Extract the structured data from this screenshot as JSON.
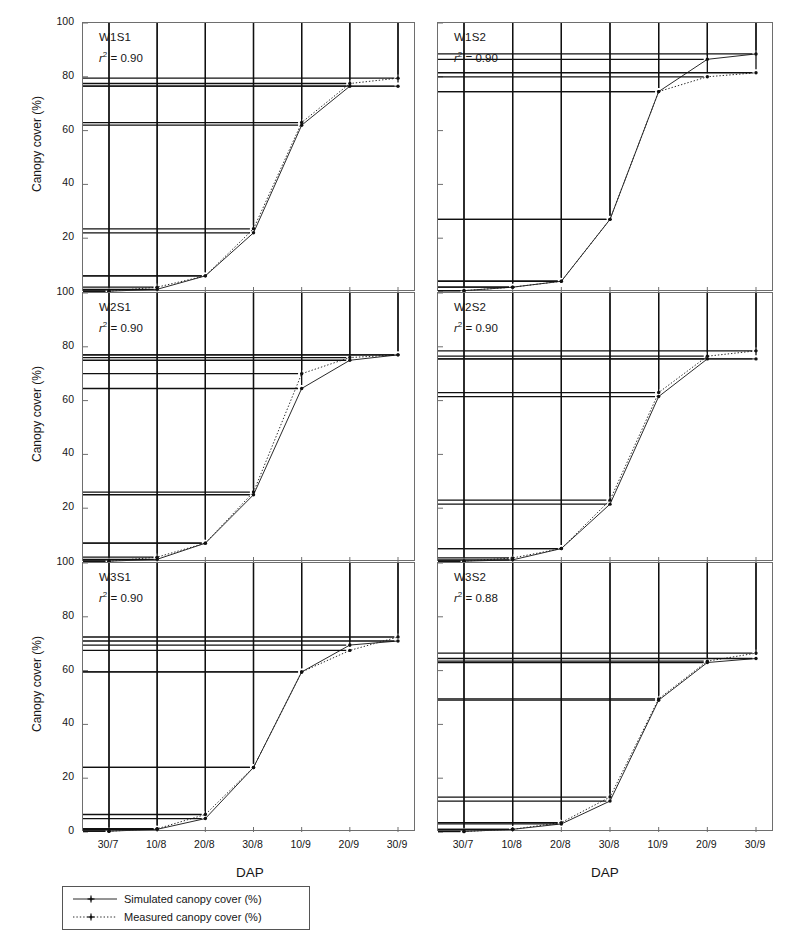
{
  "figure": {
    "axis_titles": {
      "y": "Canopy cover (%)",
      "x": "DAP"
    },
    "y_ticks": [
      "100",
      "80",
      "60",
      "40",
      "20",
      "0"
    ],
    "x_ticks": [
      "30/7",
      "10/8",
      "20/8",
      "30/8",
      "10/9",
      "20/9",
      "30/9"
    ],
    "legend": {
      "simulated": "Simulated canopy cover (%)",
      "measured": "Measured canopy cover (%)"
    },
    "colors": {
      "line": "#2a2a2a",
      "frame": "#6e6e6e",
      "marker": "#101010",
      "text": "#161616",
      "background": "#ffffff"
    }
  },
  "chart_data": {
    "type": "line",
    "title": "",
    "xlabel": "DAP",
    "ylabel": "Canopy cover (%)",
    "x": [
      "30/7",
      "10/8",
      "20/8",
      "30/8",
      "10/9",
      "20/9",
      "30/9"
    ],
    "ylim": [
      0,
      100
    ],
    "xlim_ticks": 7,
    "grid": false,
    "legend_position": "bottom-left",
    "panels": [
      {
        "id": "W1S1",
        "label": "W1S1",
        "r2_label": "r",
        "r2_sup": "2",
        "r2_value": "= 0.90",
        "r2_text": "r2 = 0.90",
        "row": 0,
        "col": 0,
        "series": [
          {
            "name": "Simulated canopy cover (%)",
            "style": "solid",
            "values": [
              0.3,
              1.0,
              6.0,
              22.0,
              62.0,
              76.5,
              76.5
            ]
          },
          {
            "name": "Measured canopy cover (%)",
            "style": "dotted",
            "values": [
              0.3,
              1.8,
              6.0,
              23.5,
              63.0,
              77.5,
              79.5
            ]
          }
        ]
      },
      {
        "id": "W1S2",
        "label": "W1S2",
        "r2_label": "r",
        "r2_sup": "2",
        "r2_value": "= 0.90",
        "r2_text": "r2 = 0.90",
        "row": 0,
        "col": 1,
        "series": [
          {
            "name": "Simulated canopy cover (%)",
            "style": "solid",
            "values": [
              0.5,
              1.8,
              4.0,
              27.0,
              74.5,
              86.5,
              88.5
            ]
          },
          {
            "name": "Measured canopy cover (%)",
            "style": "dotted",
            "values": [
              0.5,
              1.8,
              4.0,
              27.0,
              74.5,
              80.0,
              81.5
            ]
          }
        ]
      },
      {
        "id": "W2S1",
        "label": "W2S1",
        "r2_label": "r",
        "r2_sup": "2",
        "r2_value": "= 0.90",
        "r2_text": "r2 = 0.90",
        "row": 1,
        "col": 0,
        "series": [
          {
            "name": "Simulated canopy cover (%)",
            "style": "solid",
            "values": [
              0.3,
              1.0,
              7.0,
              25.0,
              64.5,
              75.0,
              77.0
            ]
          },
          {
            "name": "Measured canopy cover (%)",
            "style": "dotted",
            "values": [
              0.3,
              1.8,
              7.0,
              26.0,
              70.0,
              76.0,
              77.0
            ]
          }
        ]
      },
      {
        "id": "W2S2",
        "label": "W2S2",
        "r2_label": "r",
        "r2_sup": "2",
        "r2_value": "= 0.90",
        "r2_text": "r2 = 0.90",
        "row": 1,
        "col": 1,
        "series": [
          {
            "name": "Simulated canopy cover (%)",
            "style": "solid",
            "values": [
              0.3,
              0.8,
              5.0,
              21.5,
              61.5,
              75.5,
              75.5
            ]
          },
          {
            "name": "Measured canopy cover (%)",
            "style": "dotted",
            "values": [
              0.3,
              1.5,
              5.0,
              23.0,
              63.0,
              76.5,
              78.5
            ]
          }
        ]
      },
      {
        "id": "W3S1",
        "label": "W3S1",
        "r2_label": "r",
        "r2_sup": "2",
        "r2_value": "= 0.90",
        "r2_text": "r2 = 0.90",
        "row": 2,
        "col": 0,
        "series": [
          {
            "name": "Simulated canopy cover (%)",
            "style": "solid",
            "values": [
              0.3,
              1.0,
              5.0,
              24.0,
              59.5,
              69.5,
              71.0
            ]
          },
          {
            "name": "Measured canopy cover (%)",
            "style": "dotted",
            "values": [
              0.3,
              1.2,
              6.5,
              24.0,
              59.5,
              67.5,
              72.5
            ]
          }
        ]
      },
      {
        "id": "W3S2",
        "label": "W3S2",
        "r2_label": "r",
        "r2_sup": "2",
        "r2_value": "= 0.88",
        "r2_text": "r2 = 0.88",
        "row": 2,
        "col": 1,
        "series": [
          {
            "name": "Simulated canopy cover (%)",
            "style": "solid",
            "values": [
              0.2,
              1.0,
              3.0,
              11.5,
              49.0,
              63.0,
              64.5
            ]
          },
          {
            "name": "Measured canopy cover (%)",
            "style": "dotted",
            "values": [
              0.2,
              1.0,
              3.5,
              13.0,
              49.5,
              63.5,
              66.5
            ]
          }
        ]
      }
    ]
  }
}
